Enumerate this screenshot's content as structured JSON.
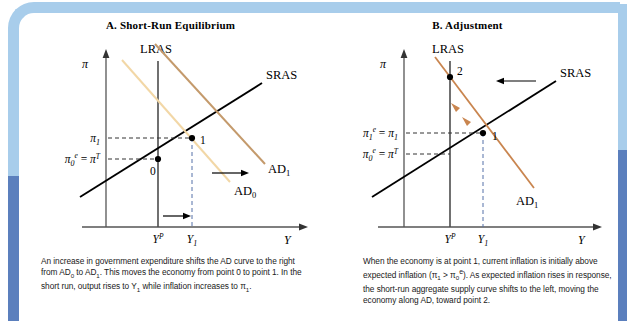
{
  "figure": {
    "frame_color_light": "#a8cdeb",
    "frame_color_dark": "#5b7fbd",
    "background": "#ffffff"
  },
  "panels": [
    {
      "id": "A",
      "title": "A. Short-Run Equilibrium",
      "axes": {
        "y_axis_label": "π",
        "x_axis_label": "Y",
        "y_ticks": [
          {
            "label": "π",
            "sub": "1",
            "sup": ""
          },
          {
            "label": "π",
            "sub": "0",
            "sup": "e",
            "equals": "= π",
            "equals_sup": "T"
          }
        ],
        "x_ticks": [
          {
            "label": "Y",
            "sup": "P"
          },
          {
            "label": "Y",
            "sub": "1"
          }
        ]
      },
      "curves": [
        {
          "name": "LRAS",
          "label": "LRAS",
          "color": "#4a4a4a"
        },
        {
          "name": "SRAS",
          "label": "SRAS",
          "color": "#000000"
        },
        {
          "name": "AD0",
          "label": "AD",
          "sub": "0",
          "color": "#f5d9a8"
        },
        {
          "name": "AD1",
          "label": "AD",
          "sub": "1",
          "color": "#c89b6a"
        }
      ],
      "points": [
        {
          "label": "0"
        },
        {
          "label": "1"
        }
      ],
      "arrows": [
        {
          "name": "ad-shift-arrow",
          "direction": "right"
        },
        {
          "name": "output-shift-arrow",
          "direction": "right"
        }
      ]
    },
    {
      "id": "B",
      "title": "B. Adjustment",
      "axes": {
        "y_axis_label": "π",
        "x_axis_label": "Y",
        "y_ticks": [
          {
            "label": "π",
            "sub": "1",
            "sup": "e",
            "equals": "= π",
            "equals_sub": "1"
          },
          {
            "label": "π",
            "sub": "0",
            "sup": "e",
            "equals": "= π",
            "equals_sup": "T"
          }
        ],
        "x_ticks": [
          {
            "label": "Y",
            "sup": "P"
          },
          {
            "label": "Y",
            "sub": "1"
          }
        ]
      },
      "curves": [
        {
          "name": "LRAS",
          "label": "LRAS",
          "color": "#4a4a4a"
        },
        {
          "name": "SRAS",
          "label": "SRAS",
          "color": "#000000"
        },
        {
          "name": "AD1",
          "label": "AD",
          "sub": "1",
          "color": "#c89b6a"
        }
      ],
      "points": [
        {
          "label": "1"
        },
        {
          "label": "2"
        }
      ],
      "arrows": [
        {
          "name": "sras-shift-left-arrow",
          "direction": "left"
        },
        {
          "name": "adjustment-arrow-lower",
          "direction": "up-left"
        },
        {
          "name": "adjustment-arrow-upper",
          "direction": "up-left"
        }
      ]
    }
  ],
  "captions": {
    "a_line1": "An increase in government expenditure shifts the AD curve",
    "a_line2_pre": "to the right from AD",
    "a_line2_sub1": "0",
    "a_line2_mid": " to AD",
    "a_line2_sub2": "1",
    "a_line2_post": ". This moves the economy from",
    "a_line3_pre": "point 0 to point 1. In the short run, output rises to Y",
    "a_line3_sub": "1",
    "a_line3_post": " while",
    "a_line4_pre": "inflation increases to π",
    "a_line4_sub": "1",
    "a_line4_post": ".",
    "b_line1": "When the economy is at point 1, current inflation is initially",
    "b_line2_pre": "above expected inflation (π",
    "b_line2_sub1": "1",
    "b_line2_mid": " > π",
    "b_line2_sub2": "0",
    "b_line2_sup2": "e",
    "b_line2_post": "). As expected inflation rises",
    "b_line3": "in response, the short-run aggregate supply curve shifts to",
    "b_line4": "the left, moving the economy along AD, toward point 2."
  }
}
